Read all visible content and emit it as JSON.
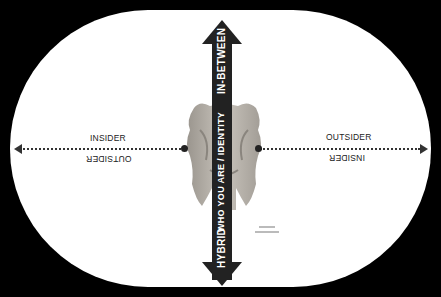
{
  "diagram": {
    "horizontal_axis": {
      "left_side": {
        "top_label": "INSIDER",
        "bottom_label_inverted": "OUTSIDER"
      },
      "right_side": {
        "top_label": "OUTSIDER",
        "bottom_label_inverted": "INSIDER"
      }
    },
    "vertical_axis": {
      "top_label": "IN-BETWEEN",
      "middle_label": "WHO YOU ARE / IDENTITY",
      "bottom_label": "HYBRID"
    },
    "center_image": "janus-two-faced-sculpture",
    "colors": {
      "background": "#000000",
      "stadium": "#ffffff",
      "arrow": "#222222",
      "text": "#222222"
    }
  }
}
